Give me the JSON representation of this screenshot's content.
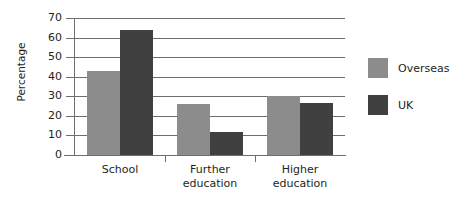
{
  "chart_data": {
    "type": "bar",
    "title": "",
    "subtitle": "",
    "xlabel": "",
    "ylabel": "Percentage",
    "categories": [
      "School",
      "Further education",
      "Higher education"
    ],
    "category_lines": [
      [
        "School"
      ],
      [
        "Further",
        "education"
      ],
      [
        "Higher",
        "education"
      ]
    ],
    "series": [
      {
        "name": "Overseas",
        "color": "#8c8c8c",
        "values": [
          43,
          26,
          30
        ]
      },
      {
        "name": "UK",
        "color": "#404040",
        "values": [
          64,
          12,
          26.5
        ]
      }
    ],
    "ylim": [
      0,
      70
    ],
    "y_ticks": [
      0,
      10,
      20,
      30,
      40,
      50,
      60,
      70
    ],
    "y_tick_labels": [
      "0",
      "10",
      "20",
      "30",
      "40",
      "50",
      "60",
      "70"
    ],
    "grid": true,
    "grid_axis": "y",
    "legend_position": "right",
    "background_color": "#ffffff",
    "axis_color": "#6d6e71",
    "text_color": "#231f20"
  },
  "legend": {
    "items": [
      {
        "label": "Overseas",
        "swatch": "overseas-swatch"
      },
      {
        "label": "UK",
        "swatch": "uk-swatch"
      }
    ]
  }
}
